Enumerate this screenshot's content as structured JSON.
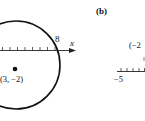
{
  "panel_a": {
    "circle": {
      "center_label": "(3, −2)",
      "center": [
        3,
        -2
      ]
    },
    "axis": {
      "label": "x",
      "tick_label": "8"
    }
  },
  "panel_b": {
    "label": "(b)",
    "point_label_partial": "(−2",
    "axis_tick_label": "−5"
  },
  "colors": {
    "ink": "#111111",
    "background": "#ffffff"
  }
}
